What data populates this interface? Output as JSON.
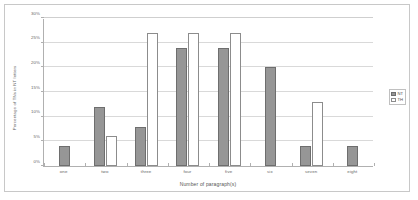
{
  "chart_data": {
    "type": "bar",
    "title": "",
    "xlabel": "Number of paragraph(s)",
    "ylabel": "Percentage of TNs in NT letters",
    "categories": [
      "one",
      "two",
      "three",
      "four",
      "five",
      "six",
      "seven",
      "eight"
    ],
    "series": [
      {
        "name": "NT",
        "values": [
          4,
          12,
          8,
          24,
          24,
          20,
          4,
          4
        ],
        "color": "#969696"
      },
      {
        "name": "TH",
        "values": [
          0,
          6,
          27,
          27,
          27,
          0,
          13,
          0
        ],
        "color": "#ffffff"
      }
    ],
    "ylim": [
      0,
      30
    ],
    "yticks": [
      "0%",
      "5%",
      "10%",
      "15%",
      "20%",
      "25%",
      "30%"
    ],
    "ytick_values": [
      0,
      5,
      10,
      15,
      20,
      25,
      30
    ],
    "grid": true,
    "legend_position": "right"
  },
  "legend": {
    "entries": [
      {
        "label": "NT"
      },
      {
        "label": "TH"
      }
    ]
  }
}
